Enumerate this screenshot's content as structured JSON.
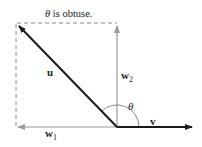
{
  "title": "θ is obtuse.",
  "title_theta": "θ",
  "title_rest": " is obtuse.",
  "labels": {
    "u": "u",
    "v": "v",
    "w1": "w",
    "w1_sub": "1",
    "w2": "w",
    "w2_sub": "2",
    "theta": "θ"
  },
  "colors": {
    "vector": "#1a1a1a",
    "projection": "#9a9a9a",
    "dashed": "#8a8a8a",
    "arc": "#8a8a8a"
  }
}
